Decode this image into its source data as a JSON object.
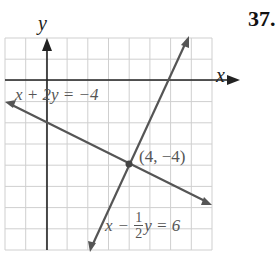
{
  "problem_number": "37.",
  "axes": {
    "x_label": "x",
    "y_label": "y"
  },
  "graph": {
    "grid": {
      "x_min": -2,
      "x_max": 8,
      "y_min": -8,
      "y_max": 2
    },
    "lines": [
      {
        "equation": "x + 2y = −4",
        "from": [
          -2,
          -1
        ],
        "to": [
          8,
          -6
        ]
      },
      {
        "equation_parts": {
          "x": "x",
          "minus": "−",
          "num": "1",
          "den": "2",
          "rest": "y = 6"
        },
        "from": [
          2,
          -8
        ],
        "to": [
          7.5,
          3
        ]
      }
    ],
    "intersection": {
      "label": "(4, −4)",
      "x": 4,
      "y": -4
    }
  },
  "colors": {
    "line": "#555555",
    "grid": "#c8c8c8",
    "axis": "#222222"
  }
}
